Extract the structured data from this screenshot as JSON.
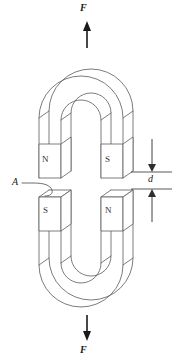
{
  "figure": {
    "background_color": "#ffffff",
    "line_color": "#5a5a5a",
    "annotation_color": "#1a1a1a"
  },
  "labels": {
    "force_top": "F",
    "force_bottom": "F",
    "gap_dimension": "d",
    "area_callout": "A"
  },
  "poles": {
    "upper_left": "N",
    "upper_right": "S",
    "lower_left": "S",
    "lower_right": "N"
  },
  "arrows": {
    "top_direction": "up",
    "bottom_direction": "down",
    "dimension_top_direction": "down",
    "dimension_bottom_direction": "up"
  },
  "icons": {
    "force_arrow_up": "arrow-up-icon",
    "force_arrow_down": "arrow-down-icon",
    "dimension_arrow": "dimension-arrow-icon",
    "leader": "leader-line-icon"
  }
}
